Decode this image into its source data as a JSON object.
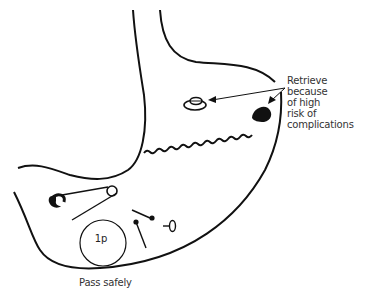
{
  "diagram": {
    "annotations": {
      "retrieve": {
        "lines": [
          "Retrieve",
          "because",
          "of high",
          "risk of",
          "complications"
        ]
      },
      "pass": "Pass safely",
      "coin": "1p"
    },
    "objects": {
      "retrieve": [
        "button-battery",
        "needle-with-thread"
      ],
      "pass": [
        "safety-pin",
        "coin-1p",
        "pins",
        "small-pin"
      ]
    },
    "colors": {
      "stroke": "#111111",
      "text": "#333333",
      "background": "#ffffff"
    }
  }
}
